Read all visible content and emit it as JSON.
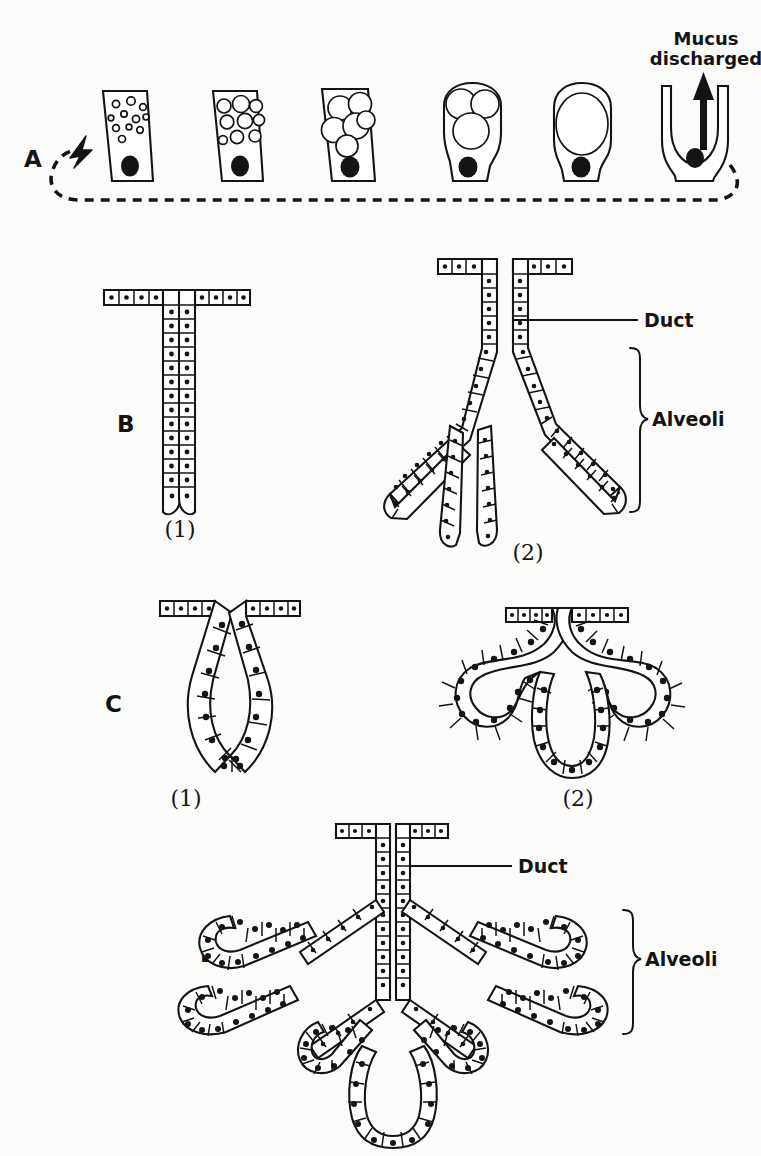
{
  "figure": {
    "background_color": "#fbfbfa",
    "ink_color": "#141414"
  },
  "panels": [
    {
      "letter": "A",
      "name": "goblet-cell-secretion-cycle",
      "caption": "",
      "annotations": [
        {
          "name": "mucus-discharged-label",
          "line1": "Mucus",
          "line2": "discharged"
        }
      ],
      "stages": [
        {
          "index": 1,
          "shape": "goblet-tapered",
          "vacuole_count": 11,
          "vacuole_size": "tiny",
          "nucleus": "basal-round"
        },
        {
          "index": 2,
          "shape": "goblet-tapered",
          "vacuole_count": 8,
          "vacuole_size": "small",
          "nucleus": "basal-round"
        },
        {
          "index": 3,
          "shape": "goblet-tapered",
          "vacuole_count": 6,
          "vacuole_size": "large",
          "nucleus": "basal-round"
        },
        {
          "index": 4,
          "shape": "goblet-swollen",
          "vacuole_count": 3,
          "vacuole_size": "very-large",
          "nucleus": "basal-round"
        },
        {
          "index": 5,
          "shape": "goblet-swollen",
          "vacuole_count": 1,
          "vacuole_size": "single-huge",
          "nucleus": "basal-round"
        },
        {
          "index": 6,
          "shape": "goblet-discharged-cup",
          "vacuole_count": 0,
          "vacuole_size": "none",
          "nucleus": "basal-round"
        }
      ],
      "cycle_arrow": "dashed-loop-returning-to-stage-1"
    },
    {
      "letter": "B",
      "name": "tubular-glands",
      "sub": [
        {
          "label": "(1)",
          "name": "simple-tubular-gland"
        },
        {
          "label": "(2)",
          "name": "compound-tubular-gland",
          "annotations": [
            {
              "name": "duct-label",
              "text": "Duct"
            },
            {
              "name": "alveoli-label",
              "text": "Alveoli"
            }
          ]
        }
      ]
    },
    {
      "letter": "C",
      "name": "alveolar-glands",
      "sub": [
        {
          "label": "(1)",
          "name": "simple-alveolar-gland"
        },
        {
          "label": "(2)",
          "name": "branched-alveolar-gland"
        }
      ]
    },
    {
      "letter": "D",
      "name": "compound-racemose-gland",
      "annotations": [
        {
          "name": "duct-label",
          "text": "Duct"
        },
        {
          "name": "alveoli-label",
          "text": "Alveoli"
        }
      ]
    }
  ],
  "labels": {
    "a": "A",
    "b": "B",
    "c": "C",
    "d": "D",
    "one": "(1)",
    "two": "(2)",
    "duct": "Duct",
    "alveoli": "Alveoli",
    "mucus_line1": "Mucus",
    "mucus_line2": "discharged"
  }
}
